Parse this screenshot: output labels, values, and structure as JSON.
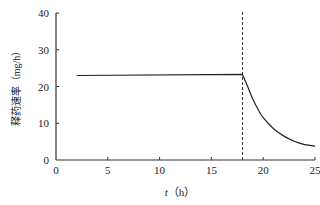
{
  "chart_data": {
    "type": "line",
    "title": "",
    "xlabel_var": "t",
    "xlabel_unit": "（h）",
    "xlabel": "t（h）",
    "ylabel": "释药速率（mg/h）",
    "xlim": [
      0,
      25
    ],
    "ylim": [
      0,
      40
    ],
    "x_ticks": [
      0,
      5,
      10,
      15,
      20,
      25
    ],
    "y_ticks": [
      0,
      10,
      20,
      30,
      40
    ],
    "grid": false,
    "legend": null,
    "series": [
      {
        "name": "release rate",
        "x": [
          2,
          18,
          18.5,
          19,
          19.5,
          20,
          21,
          22,
          23,
          24,
          25
        ],
        "y": [
          23,
          23.3,
          20,
          16.5,
          13.8,
          11.5,
          8.5,
          6.5,
          5.1,
          4.2,
          3.8
        ],
        "style": "solid"
      }
    ],
    "annotations": [
      {
        "type": "vertical-dashed-line",
        "x": 18
      }
    ]
  },
  "colors": {
    "line": "#222222",
    "axis": "#333333"
  }
}
